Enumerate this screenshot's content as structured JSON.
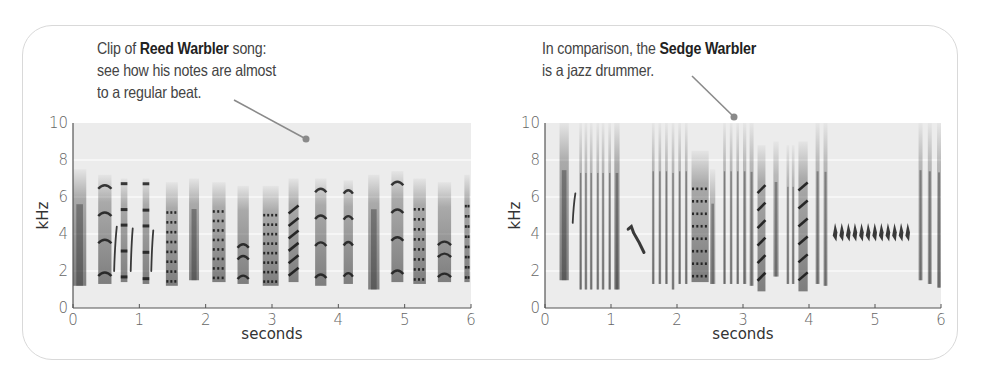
{
  "figure": {
    "left_annotation": {
      "prefix": "Clip of ",
      "bold": "Reed Warbler",
      "suffix": " song:",
      "line2": "see how his notes are almost",
      "line3": "to a regular beat."
    },
    "right_annotation": {
      "prefix": "In comparison, the ",
      "bold": "Sedge Warbler",
      "line2": "is a jazz drummer."
    },
    "colors": {
      "plot_bg": "#ececec",
      "grid": "#ffffff",
      "ink": "#1a1a1a",
      "pointer": "#8a8a8a",
      "border": "#d9d9d9"
    }
  },
  "chart_data": [
    {
      "type": "heatmap",
      "title": "Reed Warbler song (spectrogram)",
      "xlabel": "seconds",
      "ylabel": "kHz",
      "xlim": [
        0,
        6
      ],
      "ylim": [
        0,
        10
      ],
      "xticks": [
        "0",
        "1",
        "2",
        "3",
        "4",
        "5",
        "6"
      ],
      "yticks": [
        "0",
        "2",
        "4",
        "6",
        "8",
        "10"
      ],
      "grid": true,
      "note_segments": [
        {
          "start": 0.0,
          "end": 0.2,
          "fmin": 1.2,
          "fmax": 7.5,
          "pattern": "broadband"
        },
        {
          "start": 0.38,
          "end": 0.58,
          "fmin": 1.3,
          "fmax": 7.2,
          "pattern": "arches"
        },
        {
          "start": 0.62,
          "end": 0.66,
          "fmin": 2.0,
          "fmax": 4.4,
          "pattern": "sweep"
        },
        {
          "start": 0.72,
          "end": 0.82,
          "fmin": 1.4,
          "fmax": 7.0,
          "pattern": "bars"
        },
        {
          "start": 0.87,
          "end": 0.9,
          "fmin": 2.0,
          "fmax": 4.3,
          "pattern": "sweep"
        },
        {
          "start": 1.05,
          "end": 1.15,
          "fmin": 1.3,
          "fmax": 7.0,
          "pattern": "bars"
        },
        {
          "start": 1.18,
          "end": 1.21,
          "fmin": 2.0,
          "fmax": 4.2,
          "pattern": "sweep"
        },
        {
          "start": 1.4,
          "end": 1.58,
          "fmin": 1.2,
          "fmax": 6.8,
          "pattern": "dotted"
        },
        {
          "start": 1.75,
          "end": 1.9,
          "fmin": 1.5,
          "fmax": 7.0,
          "pattern": "broadband"
        },
        {
          "start": 2.1,
          "end": 2.3,
          "fmin": 1.4,
          "fmax": 6.8,
          "pattern": "dotted"
        },
        {
          "start": 2.48,
          "end": 2.65,
          "fmin": 1.3,
          "fmax": 6.6,
          "pattern": "bands"
        },
        {
          "start": 2.86,
          "end": 3.1,
          "fmin": 1.2,
          "fmax": 6.6,
          "pattern": "dotted"
        },
        {
          "start": 3.25,
          "end": 3.4,
          "fmin": 1.4,
          "fmax": 7.0,
          "pattern": "diagonals"
        },
        {
          "start": 3.65,
          "end": 3.82,
          "fmin": 1.2,
          "fmax": 7.0,
          "pattern": "arches"
        },
        {
          "start": 4.08,
          "end": 4.22,
          "fmin": 1.3,
          "fmax": 6.9,
          "pattern": "arches"
        },
        {
          "start": 4.45,
          "end": 4.62,
          "fmin": 1.0,
          "fmax": 7.2,
          "pattern": "broadband"
        },
        {
          "start": 4.8,
          "end": 4.98,
          "fmin": 1.4,
          "fmax": 7.4,
          "pattern": "arches"
        },
        {
          "start": 5.13,
          "end": 5.32,
          "fmin": 1.3,
          "fmax": 7.0,
          "pattern": "dotted"
        },
        {
          "start": 5.5,
          "end": 5.7,
          "fmin": 1.4,
          "fmax": 6.8,
          "pattern": "bands"
        },
        {
          "start": 5.9,
          "end": 5.98,
          "fmin": 1.4,
          "fmax": 7.2,
          "pattern": "dotted"
        }
      ]
    },
    {
      "type": "heatmap",
      "title": "Sedge Warbler song (spectrogram)",
      "xlabel": "seconds",
      "ylabel": "kHz",
      "xlim": [
        0,
        6
      ],
      "ylim": [
        0,
        10
      ],
      "xticks": [
        "0",
        "1",
        "2",
        "3",
        "4",
        "5",
        "6"
      ],
      "yticks": [
        "0",
        "2",
        "4",
        "6",
        "8",
        "10"
      ],
      "grid": true,
      "note_segments": [
        {
          "start": 0.22,
          "end": 0.36,
          "fmin": 1.5,
          "fmax": 10,
          "pattern": "broadband"
        },
        {
          "start": 0.42,
          "end": 0.46,
          "fmin": 4.6,
          "fmax": 6.2,
          "pattern": "sweep"
        },
        {
          "start": 0.52,
          "end": 0.56,
          "fmin": 1.0,
          "fmax": 10,
          "pattern": "click"
        },
        {
          "start": 0.6,
          "end": 0.64,
          "fmin": 1.0,
          "fmax": 10,
          "pattern": "click"
        },
        {
          "start": 0.68,
          "end": 0.72,
          "fmin": 1.0,
          "fmax": 10,
          "pattern": "click"
        },
        {
          "start": 0.78,
          "end": 0.82,
          "fmin": 1.0,
          "fmax": 10,
          "pattern": "click"
        },
        {
          "start": 0.86,
          "end": 0.9,
          "fmin": 1.0,
          "fmax": 10,
          "pattern": "click"
        },
        {
          "start": 0.96,
          "end": 1.0,
          "fmin": 1.0,
          "fmax": 10,
          "pattern": "click"
        },
        {
          "start": 1.05,
          "end": 1.13,
          "fmin": 1.0,
          "fmax": 10,
          "pattern": "broadband"
        },
        {
          "start": 1.26,
          "end": 1.5,
          "fmin": 3.0,
          "fmax": 4.4,
          "pattern": "downsweep"
        },
        {
          "start": 1.62,
          "end": 1.66,
          "fmin": 1.3,
          "fmax": 10,
          "pattern": "click"
        },
        {
          "start": 1.72,
          "end": 1.76,
          "fmin": 1.3,
          "fmax": 10,
          "pattern": "click"
        },
        {
          "start": 1.82,
          "end": 1.86,
          "fmin": 1.3,
          "fmax": 10,
          "pattern": "click"
        },
        {
          "start": 1.92,
          "end": 1.96,
          "fmin": 1.0,
          "fmax": 10,
          "pattern": "click"
        },
        {
          "start": 2.02,
          "end": 2.06,
          "fmin": 1.3,
          "fmax": 10,
          "pattern": "click"
        },
        {
          "start": 2.12,
          "end": 2.16,
          "fmin": 1.3,
          "fmax": 10,
          "pattern": "click"
        },
        {
          "start": 2.22,
          "end": 2.48,
          "fmin": 1.4,
          "fmax": 8.5,
          "pattern": "dotted"
        },
        {
          "start": 2.5,
          "end": 2.58,
          "fmin": 1.3,
          "fmax": 7.5,
          "pattern": "click"
        },
        {
          "start": 2.7,
          "end": 2.74,
          "fmin": 1.3,
          "fmax": 10,
          "pattern": "click"
        },
        {
          "start": 2.8,
          "end": 2.84,
          "fmin": 1.3,
          "fmax": 10,
          "pattern": "click"
        },
        {
          "start": 2.9,
          "end": 2.94,
          "fmin": 1.3,
          "fmax": 10,
          "pattern": "click"
        },
        {
          "start": 3.0,
          "end": 3.05,
          "fmin": 1.3,
          "fmax": 10,
          "pattern": "click"
        },
        {
          "start": 3.1,
          "end": 3.16,
          "fmin": 1.2,
          "fmax": 10,
          "pattern": "click"
        },
        {
          "start": 3.22,
          "end": 3.34,
          "fmin": 0.9,
          "fmax": 8.8,
          "pattern": "diagonals"
        },
        {
          "start": 3.46,
          "end": 3.54,
          "fmin": 1.7,
          "fmax": 9.0,
          "pattern": "click"
        },
        {
          "start": 3.66,
          "end": 3.7,
          "fmin": 1.3,
          "fmax": 8.8,
          "pattern": "click"
        },
        {
          "start": 3.74,
          "end": 3.78,
          "fmin": 1.3,
          "fmax": 8.8,
          "pattern": "click"
        },
        {
          "start": 3.84,
          "end": 3.98,
          "fmin": 0.9,
          "fmax": 9.0,
          "pattern": "diagonals"
        },
        {
          "start": 4.1,
          "end": 4.16,
          "fmin": 1.3,
          "fmax": 10,
          "pattern": "click"
        },
        {
          "start": 4.22,
          "end": 4.28,
          "fmin": 1.2,
          "fmax": 10,
          "pattern": "click"
        },
        {
          "start": 4.36,
          "end": 5.56,
          "fmin": 3.6,
          "fmax": 4.6,
          "pattern": "trill",
          "count": 12
        },
        {
          "start": 5.66,
          "end": 5.72,
          "fmin": 1.5,
          "fmax": 10,
          "pattern": "click"
        },
        {
          "start": 5.8,
          "end": 5.86,
          "fmin": 1.3,
          "fmax": 10,
          "pattern": "click"
        },
        {
          "start": 5.94,
          "end": 6.0,
          "fmin": 1.1,
          "fmax": 10,
          "pattern": "click"
        }
      ]
    }
  ]
}
